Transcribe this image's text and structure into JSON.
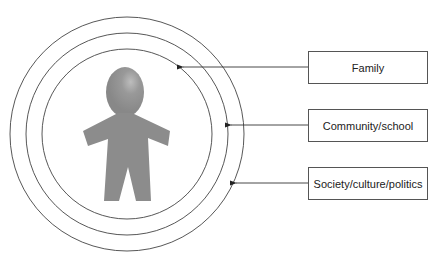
{
  "diagram": {
    "type": "concentric-circles-model",
    "center_figure": "child-figure",
    "layers": [
      {
        "label": "Family",
        "ring": "inner"
      },
      {
        "label": "Community/school",
        "ring": "middle"
      },
      {
        "label": "Society/culture/politics",
        "ring": "outer"
      }
    ],
    "colors": {
      "figure": "#8c8c8c",
      "lines": "#333333"
    }
  }
}
